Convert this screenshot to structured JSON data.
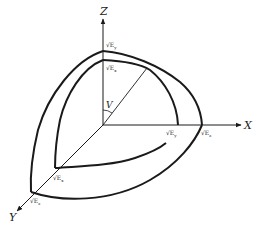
{
  "diagram": {
    "type": "3d-surface-octant",
    "axes": {
      "x": {
        "label": "X"
      },
      "y": {
        "label": "Y"
      },
      "z": {
        "label": "Z"
      }
    },
    "angle_label": "V",
    "outer_surface": {
      "z_intercept": {
        "base": "√E",
        "sub": "y"
      },
      "x_intercept": {
        "base": "√E",
        "sub": "z"
      },
      "y_intercept": {
        "base": "√E",
        "sub": "z"
      }
    },
    "inner_surface": {
      "z_intercept": {
        "base": "√E",
        "sub": "x"
      },
      "x_intercept": {
        "base": "√E",
        "sub": "y"
      },
      "y_intercept": {
        "base": "√E",
        "sub": "x"
      }
    },
    "colors": {
      "stroke": "#1a1a1a",
      "background": "#ffffff"
    }
  }
}
